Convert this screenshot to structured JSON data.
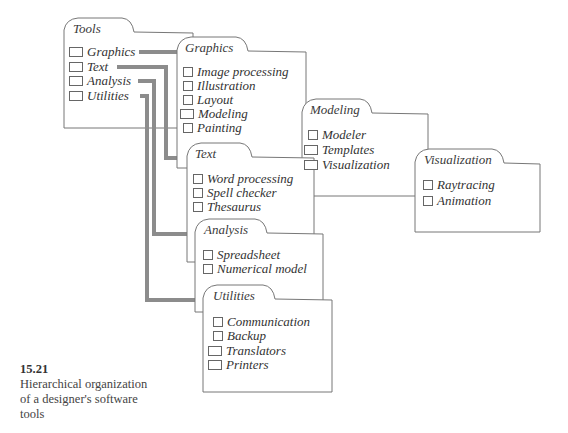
{
  "folders": {
    "tools": {
      "title": "Tools",
      "items": [
        "Graphics",
        "Text",
        "Analysis",
        "Utilities"
      ]
    },
    "graphics": {
      "title": "Graphics",
      "items": [
        "Image processing",
        "Illustration",
        "Layout",
        "Modeling",
        "Painting"
      ]
    },
    "modeling": {
      "title": "Modeling",
      "items": [
        "Modeler",
        "Templates",
        "Visualization"
      ]
    },
    "visualization": {
      "title": "Visualization",
      "items": [
        "Raytracing",
        "Animation"
      ]
    },
    "text": {
      "title": "Text",
      "items": [
        "Word processing",
        "Spell checker",
        "Thesaurus"
      ]
    },
    "analysis": {
      "title": "Analysis",
      "items": [
        "Spreadsheet",
        "Numerical model"
      ]
    },
    "utilities": {
      "title": "Utilities",
      "items": [
        "Communication",
        "Backup",
        "Translators",
        "Printers"
      ]
    }
  },
  "caption": {
    "number": "15.21",
    "lines": [
      "Hierarchical organization",
      "of a designer's software",
      "tools"
    ]
  },
  "colors": {
    "outline": "#777777",
    "connector": "#8c8c8c",
    "text": "#333333"
  }
}
